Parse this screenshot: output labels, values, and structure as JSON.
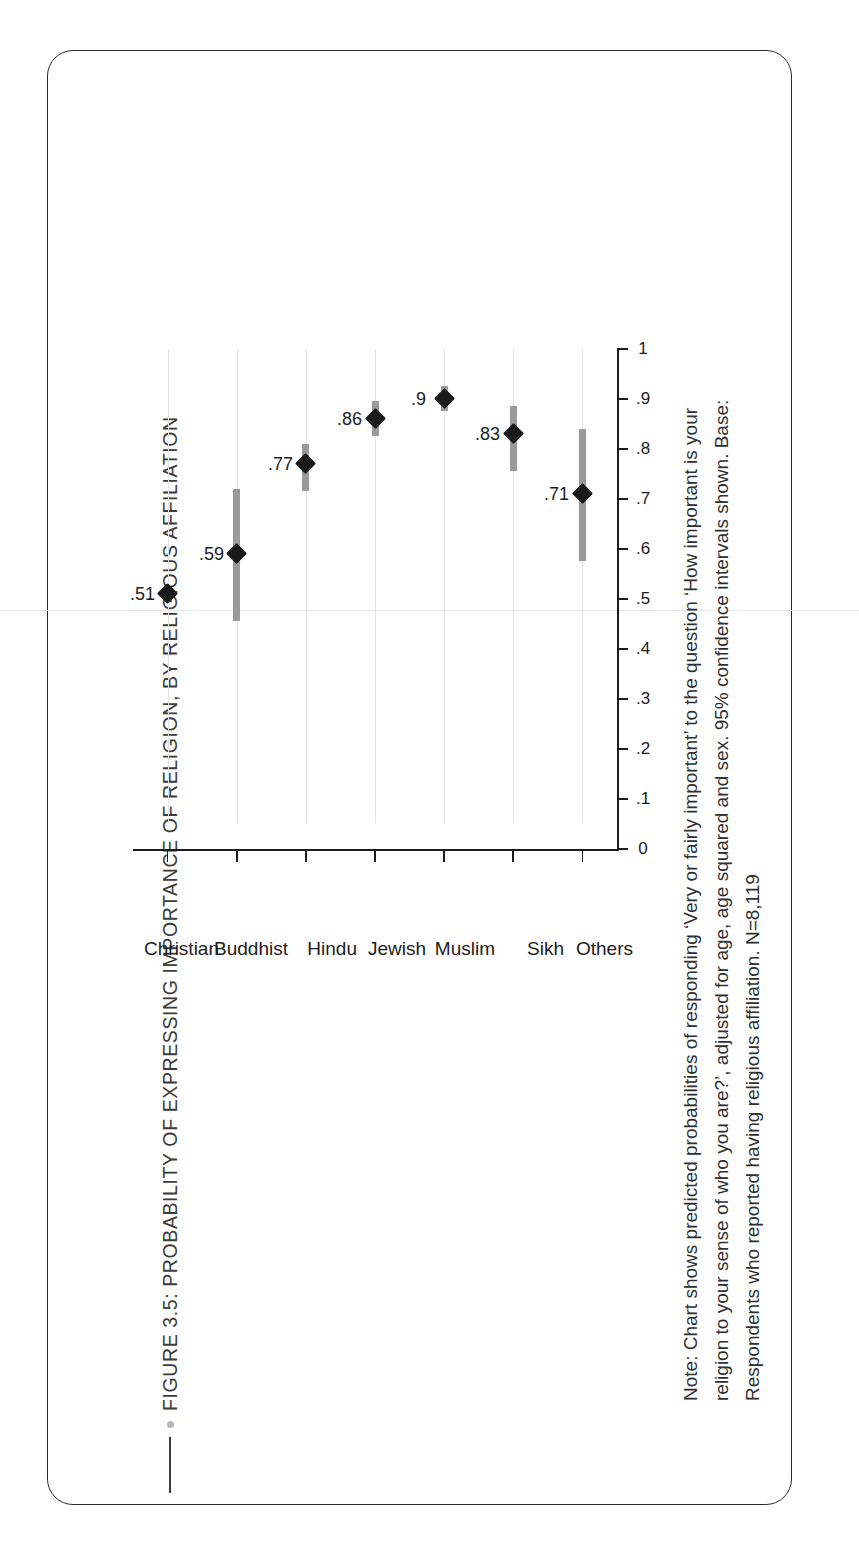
{
  "figure": {
    "title": "FIGURE 3.5: PROBABILITY  OF EXPRESSING IMPORTANCE OF RELIGION, BY RELIGIOUS AFFILIATION",
    "note": "Note: Chart shows predicted probabilities of responding ‘Very or fairly important’ to the question ‘How important is your religion to your sense of who you are?’, adjusted for age, age squared and sex. 95% confidence intervals shown. Base: Respondents who reported having religious affiliation. N=8,119",
    "title_dot_color": "#b7b7b7",
    "rule_color": "#3a3a3a"
  },
  "chart_data": {
    "type": "scatter",
    "orientation": "horizontal-dotplot-with-error-bars",
    "title": "FIGURE 3.5: PROBABILITY  OF EXPRESSING IMPORTANCE OF RELIGION, BY RELIGIOUS AFFILIATION",
    "xlabel": "",
    "ylabel": "",
    "xlim": [
      0,
      1
    ],
    "grid": "category-gridlines-only",
    "legend": "none",
    "tick_labels": [
      "0",
      ".1",
      ".2",
      ".3",
      ".4",
      ".5",
      ".6",
      ".7",
      ".8",
      ".9",
      "1"
    ],
    "tick_values": [
      0,
      0.1,
      0.2,
      0.3,
      0.4,
      0.5,
      0.6,
      0.7,
      0.8,
      0.9,
      1
    ],
    "categories": [
      "Christian",
      "Buddhist",
      "Hindu",
      "Jewish",
      "Muslim",
      "Sikh",
      "Others"
    ],
    "values": [
      0.51,
      0.59,
      0.77,
      0.86,
      0.9,
      0.83,
      0.71
    ],
    "data_labels": [
      ".51",
      ".59",
      ".77",
      ".86",
      ".9",
      ".83",
      ".71"
    ],
    "ci_low": [
      0.495,
      0.455,
      0.715,
      0.825,
      0.875,
      0.755,
      0.575
    ],
    "ci_high": [
      0.525,
      0.72,
      0.81,
      0.895,
      0.925,
      0.885,
      0.84
    ],
    "marker_color": "#1a1a1a",
    "ci_color": "#9a9a9a",
    "gridline_color": "#e2e2e2",
    "axis_color": "#1c1c1c"
  }
}
